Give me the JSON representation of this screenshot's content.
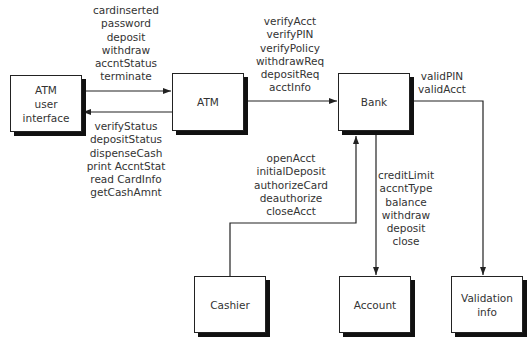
{
  "nodes": {
    "atm_ui": {
      "lines": [
        "ATM",
        "user",
        "interface"
      ]
    },
    "atm": {
      "lines": [
        "ATM"
      ]
    },
    "bank": {
      "lines": [
        "Bank"
      ]
    },
    "cashier": {
      "lines": [
        "Cashier"
      ]
    },
    "account": {
      "lines": [
        "Account"
      ]
    },
    "validation": {
      "lines": [
        "Validation",
        "info"
      ]
    }
  },
  "edges": {
    "ui_to_atm": {
      "labels": [
        "cardinserted",
        "password",
        "deposit",
        "withdraw",
        "accntStatus",
        "terminate"
      ]
    },
    "atm_to_ui": {
      "labels": [
        "verifyStatus",
        "depositStatus",
        "dispenseCash",
        "print AccntStat",
        "read CardInfo",
        "getCashAmnt"
      ]
    },
    "atm_to_bank": {
      "labels": [
        "verifyAcct",
        "verifyPIN",
        "verifyPolicy",
        "withdrawReq",
        "depositReq",
        "acctInfo"
      ]
    },
    "bank_to_validation": {
      "labels": [
        "validPIN",
        "validAcct"
      ]
    },
    "cashier_to_bank": {
      "labels": [
        "openAcct",
        "initialDeposit",
        "authorizeCard",
        "deauthorize",
        "closeAcct"
      ]
    },
    "bank_to_account": {
      "labels": [
        "creditLimit",
        "accntType",
        "balance",
        "withdraw",
        "deposit",
        "close"
      ]
    }
  },
  "colors": {
    "line": "#222222",
    "shadow": "#111111",
    "text": "#333333"
  }
}
